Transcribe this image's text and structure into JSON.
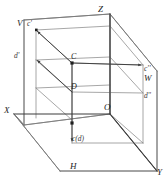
{
  "figure": {
    "type": "descriptive-geometry-diagram",
    "stroke_color_solid": "#5a5a5a",
    "stroke_color_bold": "#3c3c3c",
    "background_color": "#ffffff",
    "text_color": "#1e1e1e"
  },
  "axes": {
    "x_label": "X",
    "y_label": "Y",
    "z_label": "Z",
    "origin_label": "O"
  },
  "planes": {
    "vertical_label": "V",
    "horizontal_label": "H",
    "profile_label": "W"
  },
  "points": {
    "space_c": "C",
    "space_d": "D",
    "front_c": "c'",
    "front_d": "d'",
    "profile_c": "c''",
    "profile_d": "d''",
    "top_cd": "c(d)"
  },
  "projectors": [
    {
      "name": "c-to-front",
      "from": "C",
      "to": "c'",
      "direction": "up-left"
    },
    {
      "name": "d-to-front",
      "from": "D",
      "to": "d'",
      "direction": "up-left"
    },
    {
      "name": "c-to-profile",
      "from": "C",
      "to": "c''",
      "direction": "right"
    },
    {
      "name": "d-to-profile",
      "from": "D",
      "to": "d''",
      "direction": "right"
    },
    {
      "name": "cd-to-horizontal",
      "from": "D",
      "to": "c(d)",
      "direction": "down"
    }
  ]
}
